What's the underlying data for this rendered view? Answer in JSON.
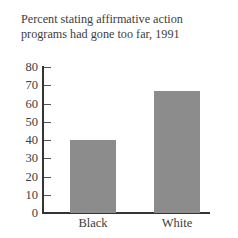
{
  "chart_data": {
    "type": "bar",
    "title": "Percent stating affirmative action programs had gone too far, 1991",
    "title_lines": [
      "Percent stating affirmative action",
      "programs had gone too far, 1991"
    ],
    "categories": [
      "Black",
      "White"
    ],
    "values": [
      40,
      67
    ],
    "xlabel": "",
    "ylabel": "",
    "ylim": [
      0,
      80
    ],
    "yticks": [
      0,
      10,
      20,
      30,
      40,
      50,
      60,
      70,
      80
    ],
    "grid": false,
    "legend": null,
    "bar_color": "#8c8c8c"
  }
}
